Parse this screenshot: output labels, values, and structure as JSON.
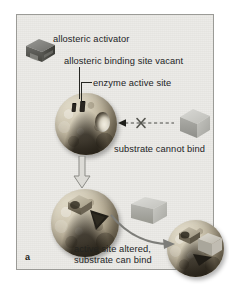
{
  "figure": {
    "panel_letter": "a",
    "background_color": "#e9e8e4",
    "border_color": "#9b9b97",
    "page_background": "#ffffff"
  },
  "labels": {
    "allosteric_activator": "allosteric activator",
    "allosteric_binding_site_vacant": "allosteric binding site vacant",
    "enzyme_active_site": "enzyme active site",
    "substrate_cannot_bind": "substrate cannot bind",
    "active_site_altered": "active site altered,",
    "substrate_can_bind": "substrate can bind"
  },
  "diagram": {
    "type": "biology-schematic",
    "topic": "Allosteric activation of an enzyme",
    "elements": [
      {
        "name": "allosteric-activator-free",
        "shape": "3d-wedge-block",
        "color": "#6e6e6a",
        "state": "unbound"
      },
      {
        "name": "enzyme-inactive",
        "shape": "sphere",
        "color": "#c3b89f",
        "state": "allosteric site vacant, active site wrong shape"
      },
      {
        "name": "substrate-free",
        "shape": "cube",
        "color": "#c9c9c5",
        "state": "cannot bind"
      },
      {
        "name": "blocked-binding-arrow",
        "shape": "dashed-arrow-with-x",
        "color": "#4a4a46",
        "state": "binding blocked"
      },
      {
        "name": "transition-arrow",
        "shape": "hollow-down-arrow",
        "color": "#8e8e8a"
      },
      {
        "name": "enzyme-activated",
        "shape": "sphere",
        "color": "#c3b89f",
        "state": "activator bound, active site altered"
      },
      {
        "name": "substrate-approaching",
        "shape": "cube",
        "color": "#c9c9c5",
        "state": "free"
      },
      {
        "name": "binding-arrow",
        "shape": "curved-arrow",
        "color": "#7d7d79"
      },
      {
        "name": "enzyme-substrate-complex",
        "shape": "sphere-with-bound-cube",
        "color": "#c3b89f",
        "state": "substrate bound"
      }
    ]
  }
}
